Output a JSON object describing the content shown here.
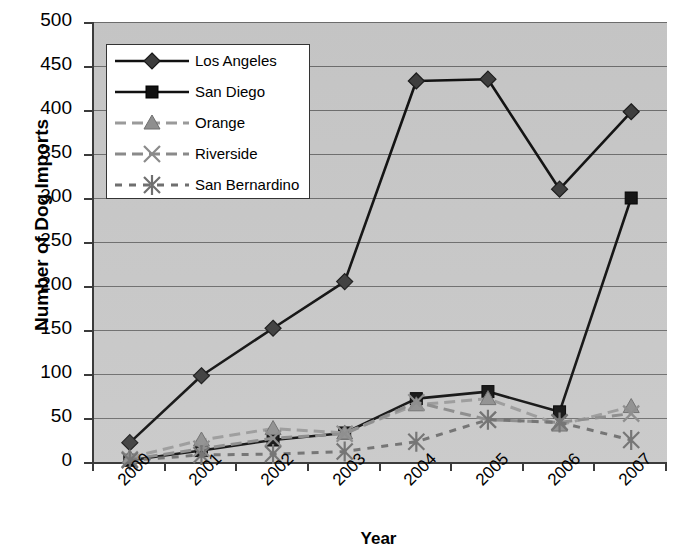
{
  "chart_data": {
    "type": "line",
    "title": "",
    "xlabel": "Year",
    "ylabel": "Number of Dog Imports",
    "categories": [
      "2000",
      "2001",
      "2002",
      "2003",
      "2004",
      "2005",
      "2006",
      "2007"
    ],
    "ylim": [
      0,
      500
    ],
    "yticks": [
      0,
      50,
      100,
      150,
      200,
      250,
      300,
      350,
      400,
      450,
      500
    ],
    "grid": true,
    "legend_position": "upper-left-inside",
    "plot_background": "#c8c8c8",
    "series": [
      {
        "name": "Los Angeles",
        "values": [
          22,
          98,
          152,
          205,
          433,
          435,
          310,
          398
        ],
        "color": "#111111",
        "marker": "diamond",
        "linestyle": "solid"
      },
      {
        "name": "San Diego",
        "values": [
          2,
          13,
          25,
          33,
          72,
          80,
          57,
          300
        ],
        "color": "#111111",
        "marker": "square",
        "linestyle": "solid"
      },
      {
        "name": "Orange",
        "values": [
          5,
          25,
          38,
          33,
          65,
          72,
          42,
          63
        ],
        "color": "#9a9a9a",
        "marker": "triangle",
        "linestyle": "dashed"
      },
      {
        "name": "Riverside",
        "values": [
          3,
          15,
          27,
          32,
          68,
          48,
          45,
          55
        ],
        "color": "#8a8a8a",
        "marker": "x",
        "linestyle": "dashed"
      },
      {
        "name": "San Bernardino",
        "values": [
          2,
          8,
          9,
          12,
          23,
          48,
          45,
          25
        ],
        "color": "#6f6f6f",
        "marker": "asterisk",
        "linestyle": "dotted"
      }
    ]
  },
  "legend": {
    "items": [
      {
        "label": "Los Angeles",
        "marker": "diamond",
        "linestyle": "solid",
        "color": "#111111"
      },
      {
        "label": "San Diego",
        "marker": "square",
        "linestyle": "solid",
        "color": "#111111"
      },
      {
        "label": "Orange",
        "marker": "triangle",
        "linestyle": "dashed",
        "color": "#9a9a9a"
      },
      {
        "label": "Riverside",
        "marker": "x",
        "linestyle": "dashed",
        "color": "#8a8a8a"
      },
      {
        "label": "San Bernardino",
        "marker": "asterisk",
        "linestyle": "dotted",
        "color": "#6f6f6f"
      }
    ]
  },
  "axes": {
    "y_title": "Number of Dog Imports",
    "x_title": "Year"
  }
}
